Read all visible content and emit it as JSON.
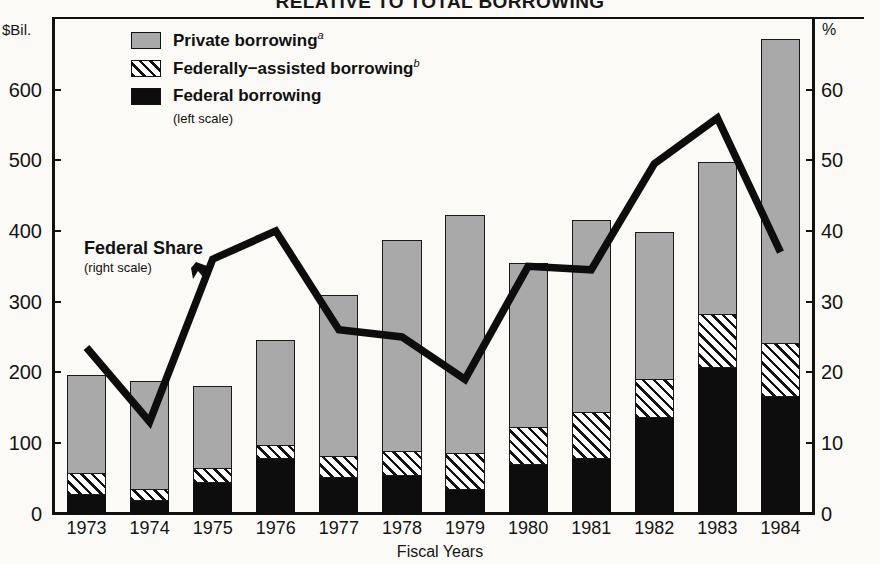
{
  "title": "RELATIVE TO TOTAL BORROWING",
  "units": {
    "left": "$Bil.",
    "right": "%"
  },
  "legend": {
    "items": [
      {
        "label": "Private borrowing",
        "note": "a",
        "swatch": "gray-fill"
      },
      {
        "label": "Federally−assisted borrowing",
        "note": "b",
        "swatch": "hatch-fill"
      },
      {
        "label": "Federal borrowing",
        "note": "",
        "swatch": "black-fill"
      }
    ],
    "scale_note": "(left scale)"
  },
  "annotation": {
    "label": "Federal Share",
    "scale_note": "(right scale)",
    "arrow": "arrow-icon"
  },
  "chart_data": {
    "type": "bar",
    "title": "RELATIVE TO TOTAL BORROWING",
    "xlabel": "Fiscal Years",
    "ylabel": "$Bil.",
    "y2label": "%",
    "ylim": [
      0,
      700
    ],
    "y2lim": [
      0,
      70
    ],
    "yticks": [
      0,
      100,
      200,
      300,
      400,
      500,
      600
    ],
    "y2ticks": [
      0,
      10,
      20,
      30,
      40,
      50,
      60
    ],
    "grid": false,
    "legend_position": "top-left",
    "stacked": true,
    "categories": [
      "1973",
      "1974",
      "1975",
      "1976",
      "1977",
      "1978",
      "1979",
      "1980",
      "1981",
      "1982",
      "1983",
      "1984"
    ],
    "series": [
      {
        "name": "Federal borrowing",
        "values": [
          27,
          19,
          45,
          79,
          51,
          55,
          35,
          70,
          78,
          136,
          208,
          166
        ]
      },
      {
        "name": "Federally−assisted borrowing",
        "values": [
          30,
          16,
          19,
          18,
          31,
          34,
          51,
          52,
          66,
          55,
          74,
          76
        ]
      },
      {
        "name": "Private borrowing",
        "values": [
          139,
          152,
          116,
          148,
          227,
          298,
          336,
          232,
          271,
          208,
          215,
          430
        ]
      }
    ],
    "totals": [
      196,
      187,
      180,
      245,
      309,
      387,
      422,
      354,
      415,
      399,
      497,
      672
    ],
    "line_series": {
      "name": "Federal Share",
      "axis": "right",
      "values": [
        23.5,
        13.0,
        36.0,
        40.0,
        26.0,
        25.0,
        19.0,
        35.0,
        34.5,
        49.5,
        56.0,
        37.0
      ]
    }
  }
}
